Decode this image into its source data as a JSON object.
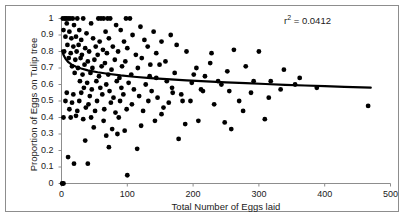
{
  "chart_data": {
    "type": "scatter",
    "title": "",
    "xlabel": "Total Number of Eggs laid",
    "ylabel": "Proportion of Eggs on Tulip tree",
    "xlim": [
      0,
      500
    ],
    "ylim": [
      0,
      1
    ],
    "xticks": [
      0,
      100,
      200,
      300,
      400,
      500
    ],
    "yticks": [
      0,
      0.1,
      0.2,
      0.3,
      0.4,
      0.5,
      0.6,
      0.7,
      0.8,
      0.9,
      1
    ],
    "xtick_labels": [
      "0",
      "100",
      "200",
      "300",
      "400",
      "500"
    ],
    "ytick_labels": [
      "0",
      "0.1",
      "0.2",
      "0.3",
      "0.4",
      "0.5",
      "0.6",
      "0.7",
      "0.8",
      "0.9",
      "1"
    ],
    "grid": false,
    "legend": null,
    "annotations": [
      {
        "name": "r-squared",
        "text_prefix": "r",
        "text_sup": "2",
        "text_suffix": " = 0.0412",
        "full_text": "r2 = 0.0412",
        "value": 0.0412
      }
    ],
    "marker": {
      "shape": "circle",
      "color": "#000000",
      "size": 4.4
    },
    "points": [
      [
        2,
        1.0
      ],
      [
        5,
        1.0
      ],
      [
        7,
        1.0
      ],
      [
        10,
        1.0
      ],
      [
        13,
        1.0
      ],
      [
        17,
        1.0
      ],
      [
        24,
        1.0
      ],
      [
        33,
        1.0
      ],
      [
        56,
        1.0
      ],
      [
        60,
        1.0
      ],
      [
        64,
        1.0
      ],
      [
        70,
        1.0
      ],
      [
        74,
        1.0
      ],
      [
        98,
        1.0
      ],
      [
        104,
        1.0
      ],
      [
        8,
        0.97
      ],
      [
        19,
        0.96
      ],
      [
        45,
        0.97
      ],
      [
        83,
        0.96
      ],
      [
        120,
        0.95
      ],
      [
        3,
        0.93
      ],
      [
        12,
        0.92
      ],
      [
        27,
        0.93
      ],
      [
        38,
        0.91
      ],
      [
        67,
        0.92
      ],
      [
        90,
        0.93
      ],
      [
        108,
        0.9
      ],
      [
        140,
        0.92
      ],
      [
        166,
        0.9
      ],
      [
        6,
        0.89
      ],
      [
        15,
        0.88
      ],
      [
        22,
        0.89
      ],
      [
        30,
        0.87
      ],
      [
        48,
        0.88
      ],
      [
        58,
        0.86
      ],
      [
        72,
        0.88
      ],
      [
        95,
        0.86
      ],
      [
        126,
        0.87
      ],
      [
        152,
        0.86
      ],
      [
        9,
        0.84
      ],
      [
        18,
        0.83
      ],
      [
        26,
        0.84
      ],
      [
        36,
        0.82
      ],
      [
        52,
        0.83
      ],
      [
        63,
        0.81
      ],
      [
        78,
        0.83
      ],
      [
        100,
        0.82
      ],
      [
        131,
        0.83
      ],
      [
        175,
        0.84
      ],
      [
        4,
        0.8
      ],
      [
        14,
        0.79
      ],
      [
        23,
        0.8
      ],
      [
        31,
        0.78
      ],
      [
        42,
        0.8
      ],
      [
        55,
        0.78
      ],
      [
        69,
        0.79
      ],
      [
        86,
        0.8
      ],
      [
        113,
        0.78
      ],
      [
        144,
        0.79
      ],
      [
        190,
        0.8
      ],
      [
        228,
        0.79
      ],
      [
        262,
        0.81
      ],
      [
        300,
        0.8
      ],
      [
        11,
        0.76
      ],
      [
        21,
        0.75
      ],
      [
        29,
        0.76
      ],
      [
        40,
        0.74
      ],
      [
        50,
        0.75
      ],
      [
        66,
        0.73
      ],
      [
        81,
        0.75
      ],
      [
        97,
        0.74
      ],
      [
        122,
        0.76
      ],
      [
        158,
        0.74
      ],
      [
        16,
        0.71
      ],
      [
        25,
        0.7
      ],
      [
        35,
        0.72
      ],
      [
        47,
        0.7
      ],
      [
        61,
        0.71
      ],
      [
        76,
        0.69
      ],
      [
        92,
        0.71
      ],
      [
        116,
        0.7
      ],
      [
        149,
        0.72
      ],
      [
        205,
        0.7
      ],
      [
        280,
        0.71
      ],
      [
        338,
        0.69
      ],
      [
        20,
        0.67
      ],
      [
        32,
        0.66
      ],
      [
        44,
        0.67
      ],
      [
        57,
        0.65
      ],
      [
        71,
        0.66
      ],
      [
        88,
        0.64
      ],
      [
        106,
        0.66
      ],
      [
        134,
        0.65
      ],
      [
        172,
        0.67
      ],
      [
        218,
        0.65
      ],
      [
        28,
        0.62
      ],
      [
        39,
        0.61
      ],
      [
        53,
        0.62
      ],
      [
        68,
        0.6
      ],
      [
        84,
        0.62
      ],
      [
        102,
        0.61
      ],
      [
        128,
        0.6
      ],
      [
        160,
        0.62
      ],
      [
        198,
        0.61
      ],
      [
        243,
        0.6
      ],
      [
        292,
        0.62
      ],
      [
        355,
        0.6
      ],
      [
        34,
        0.58
      ],
      [
        46,
        0.57
      ],
      [
        59,
        0.58
      ],
      [
        73,
        0.56
      ],
      [
        91,
        0.58
      ],
      [
        110,
        0.57
      ],
      [
        137,
        0.56
      ],
      [
        168,
        0.58
      ],
      [
        212,
        0.57
      ],
      [
        255,
        0.56
      ],
      [
        8,
        0.55
      ],
      [
        18,
        0.54
      ],
      [
        30,
        0.55
      ],
      [
        43,
        0.53
      ],
      [
        62,
        0.54
      ],
      [
        79,
        0.52
      ],
      [
        94,
        0.54
      ],
      [
        118,
        0.53
      ],
      [
        146,
        0.52
      ],
      [
        182,
        0.54
      ],
      [
        6,
        0.5
      ],
      [
        16,
        0.49
      ],
      [
        27,
        0.5
      ],
      [
        41,
        0.48
      ],
      [
        54,
        0.5
      ],
      [
        75,
        0.49
      ],
      [
        89,
        0.5
      ],
      [
        107,
        0.48
      ],
      [
        132,
        0.5
      ],
      [
        163,
        0.49
      ],
      [
        196,
        0.5
      ],
      [
        232,
        0.48
      ],
      [
        270,
        0.5
      ],
      [
        12,
        0.45
      ],
      [
        24,
        0.44
      ],
      [
        37,
        0.46
      ],
      [
        51,
        0.44
      ],
      [
        65,
        0.45
      ],
      [
        82,
        0.43
      ],
      [
        99,
        0.45
      ],
      [
        124,
        0.44
      ],
      [
        155,
        0.46
      ],
      [
        3,
        0.4
      ],
      [
        14,
        0.4
      ],
      [
        22,
        0.41
      ],
      [
        33,
        0.39
      ],
      [
        45,
        0.4
      ],
      [
        64,
        0.38
      ],
      [
        87,
        0.4
      ],
      [
        142,
        0.38
      ],
      [
        188,
        0.36
      ],
      [
        248,
        0.37
      ],
      [
        309,
        0.39
      ],
      [
        49,
        0.34
      ],
      [
        77,
        0.33
      ],
      [
        96,
        0.32
      ],
      [
        121,
        0.35
      ],
      [
        178,
        0.27
      ],
      [
        68,
        0.29
      ],
      [
        85,
        0.3
      ],
      [
        36,
        0.26
      ],
      [
        72,
        0.22
      ],
      [
        115,
        0.21
      ],
      [
        10,
        0.16
      ],
      [
        19,
        0.12
      ],
      [
        40,
        0.12
      ],
      [
        100,
        0.05
      ],
      [
        1,
        0.0
      ],
      [
        3,
        0.0
      ],
      [
        215,
        0.56
      ],
      [
        238,
        0.62
      ],
      [
        276,
        0.44
      ],
      [
        315,
        0.52
      ],
      [
        318,
        0.62
      ],
      [
        362,
        0.64
      ],
      [
        388,
        0.58
      ],
      [
        466,
        0.47
      ],
      [
        258,
        0.33
      ],
      [
        208,
        0.38
      ],
      [
        184,
        0.5
      ],
      [
        152,
        0.42
      ],
      [
        135,
        0.72
      ],
      [
        144,
        0.64
      ],
      [
        169,
        0.55
      ],
      [
        201,
        0.66
      ],
      [
        226,
        0.73
      ],
      [
        252,
        0.68
      ],
      [
        288,
        0.55
      ],
      [
        333,
        0.57
      ]
    ],
    "trendline": {
      "type": "logarithmic",
      "description": "fitted decreasing curve",
      "color": "#000000",
      "width": 2.2,
      "points": [
        [
          1,
          0.805
        ],
        [
          3,
          0.78
        ],
        [
          6,
          0.757
        ],
        [
          10,
          0.737
        ],
        [
          15,
          0.722
        ],
        [
          22,
          0.708
        ],
        [
          30,
          0.697
        ],
        [
          40,
          0.686
        ],
        [
          55,
          0.674
        ],
        [
          70,
          0.665
        ],
        [
          90,
          0.655
        ],
        [
          110,
          0.647
        ],
        [
          135,
          0.639
        ],
        [
          160,
          0.632
        ],
        [
          190,
          0.625
        ],
        [
          220,
          0.619
        ],
        [
          250,
          0.613
        ],
        [
          280,
          0.608
        ],
        [
          310,
          0.603
        ],
        [
          340,
          0.598
        ],
        [
          370,
          0.594
        ],
        [
          400,
          0.59
        ],
        [
          430,
          0.586
        ],
        [
          470,
          0.581
        ]
      ]
    }
  },
  "axes": {
    "axis_color": "#8d8d8d",
    "tick_color": "#8d8d8d",
    "text_color": "#1a1a1a"
  },
  "frame": {
    "border_color": "#8d8d8d"
  }
}
